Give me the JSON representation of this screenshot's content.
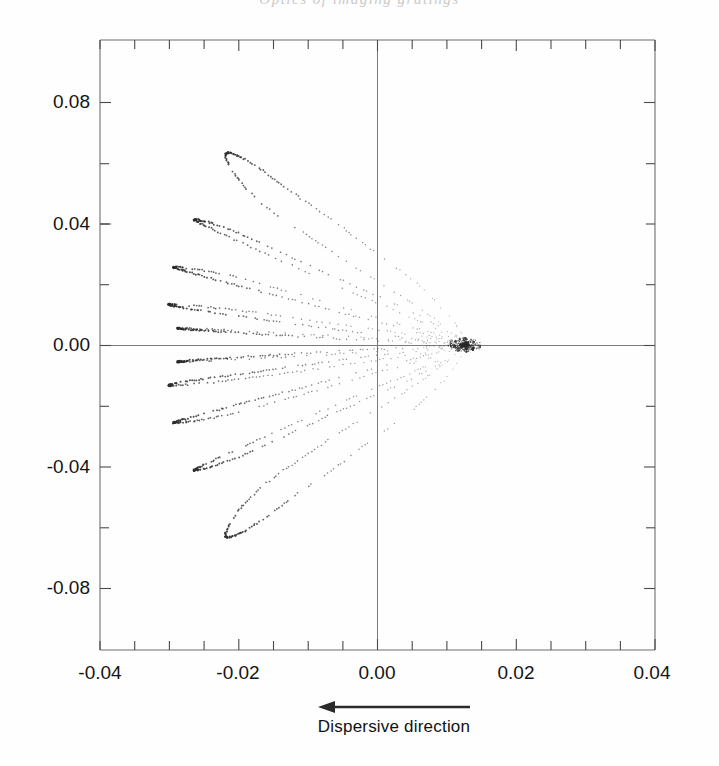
{
  "running_head": "Optics of imaging gratings",
  "figure": {
    "caption": "Dispersive direction",
    "arrow": {
      "name": "left-arrow",
      "direction": "left"
    }
  },
  "chart_data": {
    "type": "scatter",
    "title": "",
    "xlabel": "Dispersive direction",
    "ylabel": "",
    "xlim": [
      -0.04,
      0.04
    ],
    "ylim": [
      -0.105,
      0.105
    ],
    "xticks": [
      -0.04,
      -0.02,
      0.0,
      0.02,
      0.04
    ],
    "xticklabels": [
      "-0.04",
      "-0.02",
      "0.00",
      "0.02",
      "0.04"
    ],
    "yticks": [
      0.08,
      0.04,
      0.0,
      -0.04,
      -0.08
    ],
    "yticklabels": [
      "0.08",
      "0.04",
      "0.00",
      "-0.04",
      "-0.08"
    ],
    "x_minor_step": 0.005,
    "y_minor_step": 0.02,
    "grid": false,
    "legend": null,
    "zero_lines": {
      "vertical_x": 0.0,
      "horizontal_y": 0.0
    },
    "marker": "dotted-stipple",
    "color": "#2b2b2b",
    "focal_point": [
      0.0125,
      0.0
    ],
    "series": [
      {
        "name": "fan-1",
        "apex": [
          -0.0218,
          0.066
        ],
        "points_x": [
          0.0125,
          0.009,
          0.004,
          -0.003,
          -0.01,
          -0.0155,
          -0.0195,
          -0.0215,
          -0.0218,
          -0.02,
          -0.0165,
          -0.012,
          -0.0065,
          -0.001,
          0.005,
          0.01,
          0.0128
        ],
        "points_y": [
          0.0,
          0.0075,
          0.016,
          0.0265,
          0.0375,
          0.0465,
          0.0555,
          0.0625,
          0.066,
          0.065,
          0.06,
          0.052,
          0.043,
          0.033,
          0.0225,
          0.011,
          0.0015
        ]
      },
      {
        "name": "fan-2",
        "apex": [
          -0.0262,
          0.043
        ],
        "points_x": [
          0.0125,
          0.0085,
          0.003,
          -0.0045,
          -0.012,
          -0.0185,
          -0.0235,
          -0.026,
          -0.0262,
          -0.024,
          -0.02,
          -0.015,
          -0.009,
          -0.0025,
          0.0045,
          0.01,
          0.013
        ],
        "points_y": [
          0.0,
          0.0055,
          0.0115,
          0.019,
          0.027,
          0.034,
          0.0395,
          0.0425,
          0.0432,
          0.042,
          0.0385,
          0.033,
          0.0265,
          0.0195,
          0.012,
          0.005,
          0.0005
        ]
      },
      {
        "name": "fan-3",
        "apex": [
          -0.0292,
          0.026
        ],
        "points_x": [
          0.0125,
          0.008,
          0.0015,
          -0.0065,
          -0.0145,
          -0.0215,
          -0.0265,
          -0.029,
          -0.0292,
          -0.027,
          -0.0225,
          -0.017,
          -0.0105,
          -0.0035,
          0.004,
          0.0098,
          0.013
        ],
        "points_y": [
          0.0,
          0.004,
          0.0085,
          0.014,
          0.0195,
          0.024,
          0.0262,
          0.0268,
          0.0265,
          0.025,
          0.022,
          0.0185,
          0.0145,
          0.01,
          0.0055,
          0.0018,
          0.0002
        ]
      },
      {
        "name": "fan-4",
        "apex": [
          -0.03,
          0.0135
        ],
        "points_x": [
          0.0125,
          0.0075,
          0.0005,
          -0.008,
          -0.0165,
          -0.0235,
          -0.0285,
          -0.03,
          -0.0298,
          -0.0275,
          -0.023,
          -0.0175,
          -0.011,
          -0.004,
          0.0038,
          0.0097,
          0.013
        ],
        "points_y": [
          0.0,
          0.0025,
          0.005,
          0.008,
          0.0108,
          0.0128,
          0.0138,
          0.014,
          0.0136,
          0.0126,
          0.011,
          0.0092,
          0.007,
          0.0048,
          0.0025,
          0.0008,
          0.0
        ]
      },
      {
        "name": "fan-5",
        "apex": [
          -0.0288,
          0.0055
        ],
        "points_x": [
          0.0125,
          0.007,
          -0.0005,
          -0.009,
          -0.0175,
          -0.0245,
          -0.028,
          -0.0288,
          -0.0282,
          -0.0258,
          -0.0215,
          -0.016,
          -0.0098,
          -0.003,
          0.0042,
          0.0098,
          0.013
        ],
        "points_y": [
          0.0,
          0.001,
          0.0022,
          0.0035,
          0.0046,
          0.0054,
          0.0057,
          0.0058,
          0.0056,
          0.0051,
          0.0044,
          0.0036,
          0.0027,
          0.0018,
          0.0009,
          0.0003,
          0.0
        ]
      },
      {
        "name": "fan-1-mirror",
        "apex": [
          -0.0218,
          -0.066
        ],
        "mirror_of": "fan-1"
      },
      {
        "name": "fan-2-mirror",
        "apex": [
          -0.0262,
          -0.043
        ],
        "mirror_of": "fan-2"
      },
      {
        "name": "fan-3-mirror",
        "apex": [
          -0.0292,
          -0.026
        ],
        "mirror_of": "fan-3"
      },
      {
        "name": "fan-4-mirror",
        "apex": [
          -0.03,
          -0.0135
        ],
        "mirror_of": "fan-4"
      },
      {
        "name": "fan-5-mirror",
        "apex": [
          -0.0288,
          -0.0055
        ],
        "mirror_of": "fan-5"
      }
    ]
  }
}
